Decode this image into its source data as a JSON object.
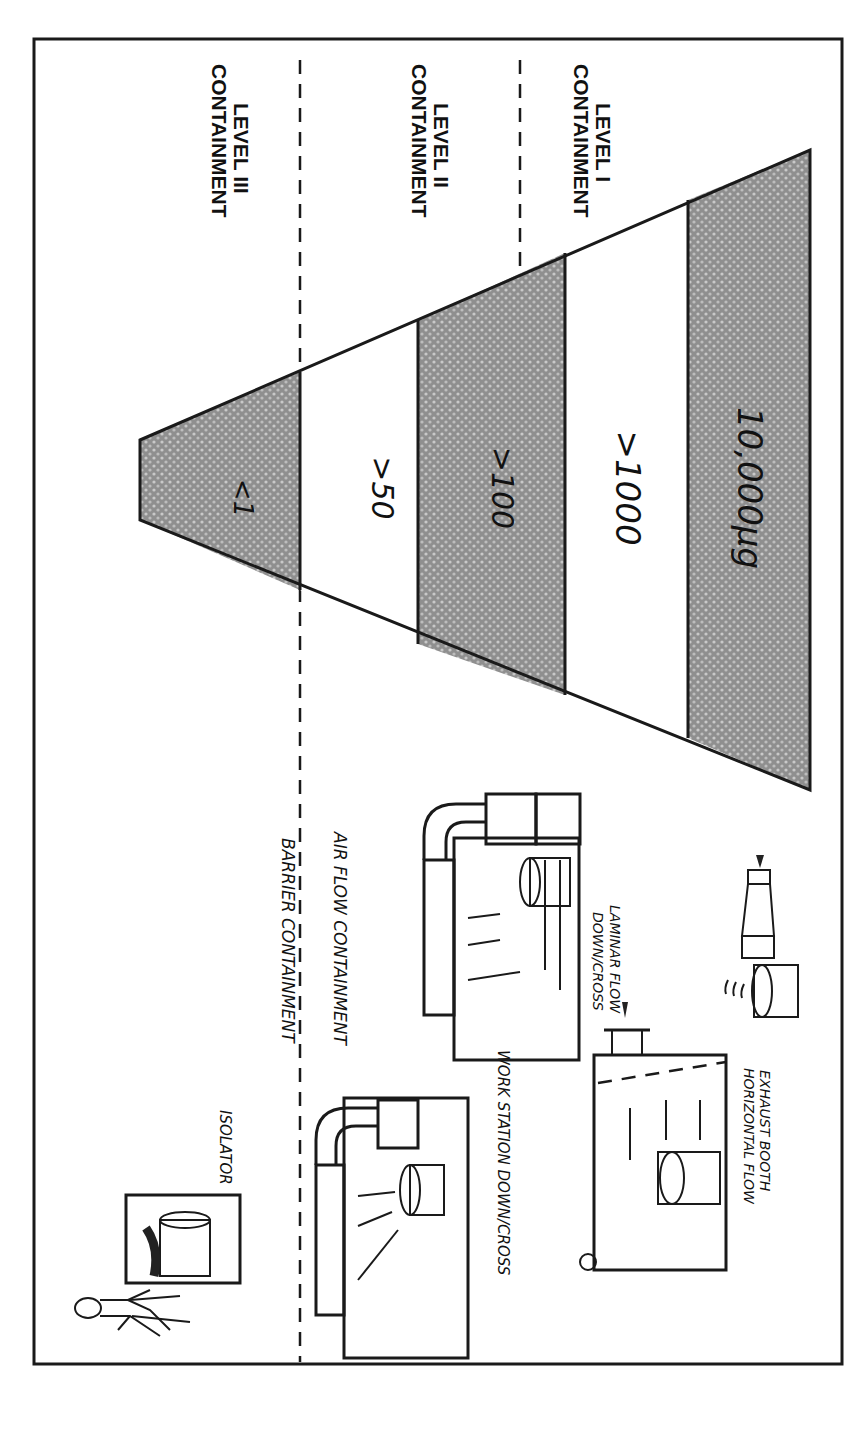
{
  "diagram": {
    "orientation": "rotated 90 degrees clockwise",
    "containment_levels": [
      {
        "id": "level-3",
        "line1": "CONTAINMENT",
        "line2": "LEVEL III"
      },
      {
        "id": "level-2",
        "line1": "CONTAINMENT",
        "line2": "LEVEL II"
      },
      {
        "id": "level-1",
        "line1": "CONTAINMENT",
        "line2": "LEVEL I"
      }
    ],
    "pyramid_bands": [
      {
        "label": "<1",
        "shaded": true
      },
      {
        "label": ">50",
        "shaded": false
      },
      {
        "label": ">100",
        "shaded": true
      },
      {
        "label": ">1000",
        "shaded": false
      },
      {
        "label": "10,000µg",
        "shaded": true
      }
    ],
    "boundary_labels": {
      "barrier": "BARRIER CONTAINMENT",
      "airflow": "AIR FLOW CONTAINMENT"
    },
    "equipment": [
      {
        "id": "isolator",
        "label": "ISOLATOR"
      },
      {
        "id": "workstation",
        "label": "WORK STATION DOWN/CROSS"
      },
      {
        "id": "laminar",
        "line1": "DOWN/CROSS",
        "line2": "LAMINAR FLOW"
      },
      {
        "id": "exhaust-booth",
        "line1": "HORIZONTAL FLOW",
        "line2": "EXHAUST BOOTH"
      }
    ],
    "colors": {
      "ink": "#1a1a1a",
      "shade": "#9a9a9a",
      "paper": "#ffffff"
    }
  }
}
